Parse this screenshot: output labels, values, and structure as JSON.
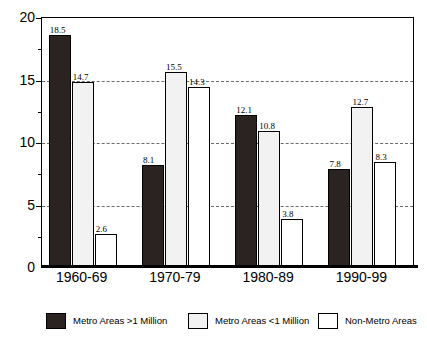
{
  "chart_data": {
    "type": "bar",
    "title": "",
    "xlabel": "",
    "ylabel": "",
    "ylim": [
      0,
      20
    ],
    "yticks": [
      0,
      5,
      10,
      15,
      20
    ],
    "ytick_labels": [
      "0",
      "5",
      "10",
      "15",
      "20"
    ],
    "minor_ytick_step": 2.5,
    "grid": "horizontal-dashed-at-major-ticks",
    "legend_position": "bottom",
    "categories": [
      "1960-69",
      "1970-79",
      "1980-89",
      "1990-99"
    ],
    "series": [
      {
        "name": "Metro Areas >1 Million",
        "fill": "dark-solid",
        "color": "#2b2222",
        "values": [
          18.5,
          8.1,
          12.1,
          7.8
        ],
        "value_labels": [
          "18.5",
          "8.1",
          "12.1",
          "7.8"
        ]
      },
      {
        "name": "Metro Areas <1 Million",
        "fill": "light-dotted",
        "color": "#f2f2f2",
        "values": [
          14.7,
          15.5,
          10.8,
          12.7
        ],
        "value_labels": [
          "14.7",
          "15.5",
          "10.8",
          "12.7"
        ]
      },
      {
        "name": "Non-Metro Areas",
        "fill": "white-empty",
        "color": "#ffffff",
        "values": [
          2.6,
          14.3,
          3.8,
          8.3
        ],
        "value_labels": [
          "2.6",
          "14.3",
          "3.8",
          "8.3"
        ]
      }
    ]
  },
  "axis": {
    "y_labels": [
      "20",
      "15",
      "10",
      "5",
      "0"
    ]
  },
  "x_axis": {
    "labels": [
      "1960-69",
      "1970-79",
      "1980-89",
      "1990-99"
    ]
  },
  "legend": {
    "items": [
      {
        "label": "Metro Areas >1 Million"
      },
      {
        "label": "Metro Areas <1 Million"
      },
      {
        "label": "Non-Metro Areas"
      }
    ]
  }
}
